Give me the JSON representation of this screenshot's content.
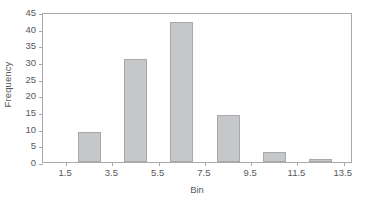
{
  "chart_data": {
    "type": "bar",
    "title": "",
    "xlabel": "Bin",
    "ylabel": "Frequency",
    "categories": [
      "2.5",
      "4.5",
      "6.5",
      "8.5",
      "10.5",
      "12.5"
    ],
    "x": [
      2.5,
      4.5,
      6.5,
      8.5,
      10.5,
      12.5
    ],
    "values": [
      9,
      31,
      42,
      14,
      3,
      1
    ],
    "xlim": [
      0.5,
      13.9
    ],
    "ylim": [
      0,
      45
    ],
    "x_ticks": [
      1.5,
      3.5,
      5.5,
      7.5,
      9.5,
      11.5,
      13.5
    ],
    "x_ticklabels": [
      "1.5",
      "3.5",
      "5.5",
      "7.5",
      "9.5",
      "11.5",
      "13.5"
    ],
    "y_ticks": [
      0,
      5,
      10,
      15,
      20,
      25,
      30,
      35,
      40,
      45
    ],
    "y_ticklabels": [
      "0",
      "5",
      "10",
      "15",
      "20",
      "25",
      "30",
      "35",
      "40",
      "45"
    ],
    "grid": false,
    "legend": "none",
    "bar_width": 1.0,
    "colors": {
      "bar_fill": "#c6c7c9",
      "bar_edge": "#a7a9ac",
      "axis": "#a7a9ac",
      "text": "#58585a",
      "background": "#ffffff"
    }
  }
}
